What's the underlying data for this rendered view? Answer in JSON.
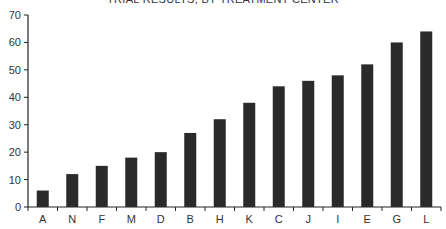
{
  "chart_data": {
    "type": "bar",
    "title": "TRIAL RESULTS, BY TREATMENT CENTER",
    "xlabel": "",
    "ylabel": "",
    "categories": [
      "A",
      "N",
      "F",
      "M",
      "D",
      "B",
      "H",
      "K",
      "C",
      "J",
      "I",
      "E",
      "G",
      "L"
    ],
    "values": [
      6,
      12,
      15,
      18,
      20,
      27,
      32,
      38,
      44,
      46,
      48,
      52,
      60,
      64
    ],
    "ylim": [
      0,
      70
    ],
    "yticks": [
      0,
      10,
      20,
      30,
      40,
      50,
      60,
      70
    ],
    "grid": false,
    "legend": null,
    "bar_color": "#2a2a2a",
    "axis_color": "#222222"
  }
}
